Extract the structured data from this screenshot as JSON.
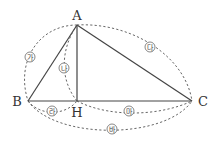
{
  "diagram": {
    "type": "right-triangle-with-altitude",
    "vertices": {
      "A": {
        "label": "A"
      },
      "B": {
        "label": "B"
      },
      "C": {
        "label": "C"
      },
      "H": {
        "label": "H"
      }
    },
    "segments": [
      {
        "from": "A",
        "to": "B",
        "style": "solid"
      },
      {
        "from": "A",
        "to": "C",
        "style": "solid"
      },
      {
        "from": "B",
        "to": "C",
        "style": "solid"
      },
      {
        "from": "A",
        "to": "H",
        "style": "solid"
      }
    ],
    "dashed_arcs": [
      {
        "id": "ga",
        "label": "㉮",
        "from": "A",
        "to": "B",
        "meaning": "length AB"
      },
      {
        "id": "na",
        "label": "㉯",
        "from": "A",
        "to": "H",
        "meaning": "length AH"
      },
      {
        "id": "da",
        "label": "㉰",
        "from": "A",
        "to": "C",
        "meaning": "length AC"
      },
      {
        "id": "ra",
        "label": "㉱",
        "from": "B",
        "to": "H",
        "meaning": "length BH"
      },
      {
        "id": "ma",
        "label": "㉲",
        "from": "H",
        "to": "C",
        "meaning": "length HC"
      },
      {
        "id": "ba",
        "label": "㉳",
        "from": "B",
        "to": "C",
        "meaning": "length BC"
      }
    ]
  },
  "labels": {
    "A": "A",
    "B": "B",
    "C": "C",
    "H": "H",
    "ga": "가",
    "na": "나",
    "da": "다",
    "ra": "라",
    "ma": "마",
    "ba": "바"
  }
}
